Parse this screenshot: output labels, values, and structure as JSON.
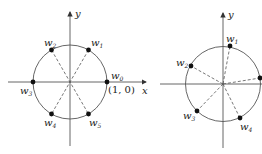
{
  "diagrams": [
    {
      "name": "sixth-roots-of-unity",
      "axes": {
        "x_label": "x",
        "y_label": "y"
      },
      "points": [
        {
          "label": "w",
          "sub": "0",
          "annotation": "(1, 0)"
        },
        {
          "label": "w",
          "sub": "1"
        },
        {
          "label": "w",
          "sub": "2"
        },
        {
          "label": "w",
          "sub": "3"
        },
        {
          "label": "w",
          "sub": "4"
        },
        {
          "label": "w",
          "sub": "5"
        }
      ]
    },
    {
      "name": "rotated-fifth-roots",
      "axes": {
        "y_label": "y"
      },
      "points": [
        {
          "label": "w",
          "sub": "1"
        },
        {
          "label": "w",
          "sub": "2"
        },
        {
          "label": "w",
          "sub": "3"
        },
        {
          "label": "w",
          "sub": "4"
        }
      ]
    }
  ],
  "colors": {
    "stroke": "#444444",
    "point": "#111111"
  }
}
